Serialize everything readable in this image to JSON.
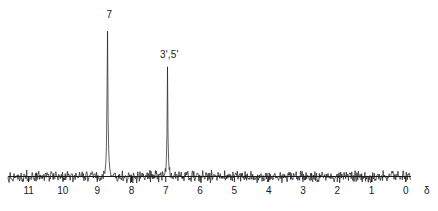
{
  "figure": {
    "kind": "nmr-spectrum",
    "line_color": "#1a1a1a",
    "background_color": "#ffffff"
  },
  "axis": {
    "symbol": "δ",
    "tick_labels": [
      "11",
      "10",
      "9",
      "8",
      "7",
      "6",
      "5",
      "4",
      "3",
      "2",
      "1",
      "0"
    ],
    "tick_values": [
      11,
      10,
      9,
      8,
      7,
      6,
      5,
      4,
      3,
      2,
      1,
      0
    ]
  },
  "peaks": [
    {
      "label": "7",
      "ppm": 8.7,
      "height": 0.98
    },
    {
      "label": "3',5'",
      "ppm": 6.95,
      "height": 0.72
    }
  ],
  "chart_data": {
    "type": "line",
    "title": "",
    "xlabel": "δ",
    "ylabel": "",
    "xlim": [
      11.6,
      -0.15
    ],
    "ylim": [
      0,
      1
    ],
    "x_reversed": true,
    "grid": false,
    "legend": "none",
    "xticks": [
      11,
      10,
      9,
      8,
      7,
      6,
      5,
      4,
      3,
      2,
      1,
      0
    ],
    "xticklabels": [
      "11",
      "10",
      "9",
      "8",
      "7",
      "6",
      "5",
      "4",
      "3",
      "2",
      "1",
      "0"
    ],
    "annotations": [
      {
        "text": "7",
        "x": 8.7,
        "y": 0.98
      },
      {
        "text": "3',5'",
        "x": 6.95,
        "y": 0.72
      }
    ],
    "series": [
      {
        "name": "1H NMR trace",
        "baseline_noise_amplitude": 0.05,
        "peaks": [
          {
            "label": "7",
            "ppm": 8.7,
            "relative_height": 0.98,
            "width_ppm": 0.06
          },
          {
            "label": "3',5'",
            "ppm": 6.95,
            "relative_height": 0.72,
            "width_ppm": 0.05
          }
        ]
      }
    ]
  }
}
